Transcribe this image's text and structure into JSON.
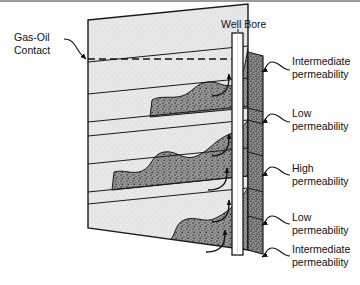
{
  "figure": {
    "type": "geologic-cross-section-diagram",
    "annotations": {
      "gas_oil_contact": "Gas-Oil\nContact",
      "gas_oil_contact_line1": "Gas-Oil",
      "gas_oil_contact_line2": "Contact",
      "well_bore": "Well Bore"
    },
    "permeability_labels": [
      {
        "line1": "Intermediate",
        "line2": "permeability"
      },
      {
        "line1": "Low",
        "line2": "permeability"
      },
      {
        "line1": "High",
        "line2": "permeability"
      },
      {
        "line1": "Low",
        "line2": "permeability"
      },
      {
        "line1": "Intermediate",
        "line2": "permeability"
      }
    ],
    "colors": {
      "light_layer": "#e4e4e4",
      "dark_layer": "#8d8d8d",
      "outline": "#1a1a1a",
      "well_bore_fill": "#ffffff",
      "border": "#9b9b9b",
      "text": "#111111"
    }
  }
}
